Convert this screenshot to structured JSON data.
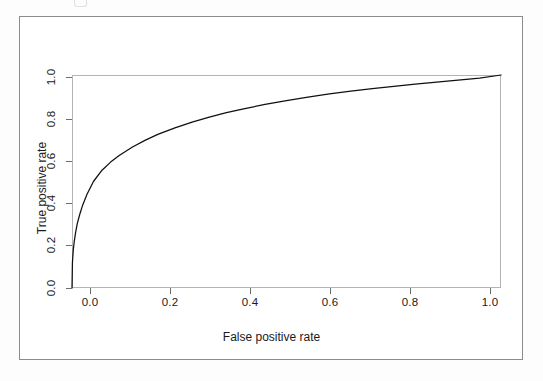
{
  "figure": {
    "background": "#ffffff",
    "frame_color": "#8c8c8c",
    "axis_color": "#6d6d6d",
    "curve_color": "#101010"
  },
  "chart_data": {
    "type": "line",
    "title": "",
    "subtitle": "",
    "xlabel": "False positive rate",
    "ylabel": "True positive rate",
    "xlim": [
      0.0,
      1.0
    ],
    "ylim": [
      0.0,
      1.0
    ],
    "grid": false,
    "legend": null,
    "legend_position": "none",
    "xticks": [
      "0.0",
      "0.2",
      "0.4",
      "0.6",
      "0.8",
      "1.0"
    ],
    "xtick_values": [
      0.0,
      0.2,
      0.4,
      0.6,
      0.8,
      1.0
    ],
    "yticks": [
      "0.0",
      "0.2",
      "0.4",
      "0.6",
      "0.8",
      "1.0"
    ],
    "ytick_values": [
      0.0,
      0.2,
      0.4,
      0.6,
      0.8,
      1.0
    ],
    "annotations": [],
    "series": [
      {
        "name": "ROC curve",
        "color": "#101010",
        "x": [
          0.0,
          0.001,
          0.003,
          0.005,
          0.008,
          0.012,
          0.018,
          0.025,
          0.035,
          0.05,
          0.07,
          0.09,
          0.11,
          0.14,
          0.17,
          0.2,
          0.24,
          0.28,
          0.32,
          0.36,
          0.4,
          0.45,
          0.5,
          0.55,
          0.6,
          0.65,
          0.7,
          0.75,
          0.8,
          0.85,
          0.9,
          0.95,
          1.0
        ],
        "y": [
          0.0,
          0.12,
          0.18,
          0.215,
          0.255,
          0.3,
          0.345,
          0.39,
          0.44,
          0.5,
          0.553,
          0.591,
          0.622,
          0.661,
          0.693,
          0.721,
          0.752,
          0.779,
          0.802,
          0.823,
          0.841,
          0.862,
          0.88,
          0.896,
          0.911,
          0.924,
          0.936,
          0.947,
          0.957,
          0.967,
          0.976,
          0.985,
          1.0
        ]
      }
    ]
  },
  "artifact": {
    "description": "faint-scan-mark"
  }
}
